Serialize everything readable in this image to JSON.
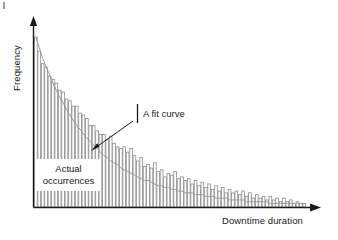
{
  "figure": {
    "name": "downtime-duration-frequency-histogram",
    "background_color": "#ffffff",
    "ink_color": "#1a1a1a",
    "bar_stroke_color": "#8d8d8d",
    "bar_fill_color": "#ffffff",
    "curve_color": "#9b9b9b"
  },
  "labels": {
    "ylabel": "Frequency",
    "xlabel": "Downtime duration",
    "fit_curve_annotation": "A fit curve",
    "actual_occurrences_line1": "Actual",
    "actual_occurrences_line2": "occurrences"
  },
  "chart_data": {
    "type": "bar",
    "title": "",
    "subtitle": "",
    "xlabel": "Downtime duration",
    "ylabel": "Frequency",
    "grid": false,
    "legend": null,
    "axis_style": "arrow-tipped open axes, no tick marks, no tick labels",
    "xlim": [
      0,
      80
    ],
    "ylim": [
      0,
      100
    ],
    "annotations": [
      {
        "text": "A fit curve",
        "target": "fit curve at approximately bin 22",
        "leader": "arrow from label down-left to curve"
      },
      {
        "text": "Actual occurrences",
        "target": "histogram bars",
        "leader": "none, white label box overlaying bars"
      }
    ],
    "series": [
      {
        "name": "Actual occurrences",
        "type": "bar",
        "values": [
          96,
          88,
          81,
          79,
          74,
          72,
          70,
          66,
          65,
          61,
          60,
          57,
          57,
          53,
          52,
          50,
          46,
          46,
          43,
          41,
          41,
          38,
          40,
          36,
          34,
          33,
          34,
          31,
          33,
          29,
          26,
          28,
          23,
          24,
          22,
          25,
          20,
          21,
          17,
          19,
          18,
          20,
          16,
          17,
          15,
          16,
          13,
          15,
          12,
          14,
          11,
          13,
          10,
          12,
          9,
          11,
          8,
          10,
          8,
          9,
          7,
          9,
          6,
          8,
          5,
          7,
          5,
          6,
          4,
          6,
          4,
          5,
          3,
          5,
          3,
          4,
          2,
          3,
          2,
          2
        ]
      },
      {
        "name": "A fit curve",
        "type": "line",
        "description": "smooth exponential decay fitted through the bar tops",
        "values": [
          96,
          90,
          84,
          79,
          75,
          70,
          66,
          62,
          59,
          55,
          52,
          49,
          46,
          44,
          41,
          39,
          37,
          35,
          33,
          31,
          29,
          28,
          26,
          25,
          24,
          22,
          21,
          20,
          19,
          18,
          17,
          16,
          15,
          15,
          14,
          13,
          12,
          12,
          11,
          11,
          10,
          10,
          9,
          9,
          8,
          8,
          8,
          7,
          7,
          7,
          6,
          6,
          6,
          5,
          5,
          5,
          5,
          4,
          4,
          4,
          4,
          4,
          3,
          3,
          3,
          3,
          3,
          3,
          3,
          2,
          2,
          2,
          2,
          2,
          2,
          2,
          2,
          2,
          2,
          2
        ]
      }
    ]
  }
}
